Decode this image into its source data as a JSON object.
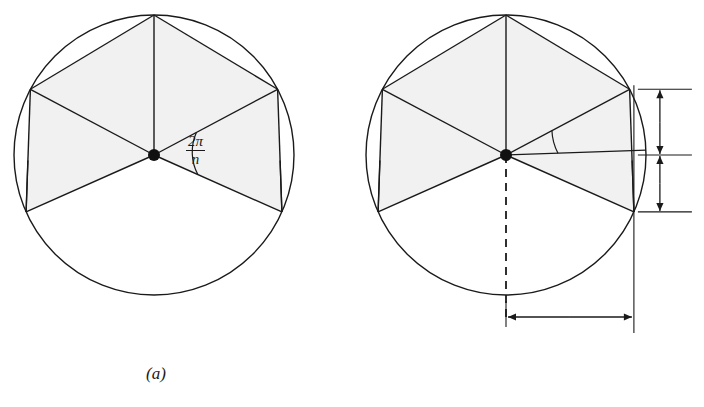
{
  "figure": {
    "kind": "geometry-diagram",
    "colors": {
      "stroke": "#1a1a1a",
      "shade": "#f1f1f1",
      "background": "#ffffff",
      "text": "#1a1a1a",
      "dashed": "#1a1a1a"
    }
  },
  "panels": [
    {
      "id": "a",
      "caption": "(a)",
      "circle": {
        "cx": 154,
        "cy": 155,
        "r": 140
      },
      "center_dot": {
        "cx": 154,
        "cy": 155,
        "r": 6
      },
      "angle_label": {
        "numerator": "2π",
        "denominator": "n",
        "full": "2π/n",
        "name": "central-angle"
      },
      "vertex_angles_deg": [
        -24,
        28,
        90,
        152,
        204
      ],
      "shaded_triangles": 4,
      "partial_chord_stubs": 2
    },
    {
      "id": "b",
      "caption": "(b)",
      "circle": {
        "cx": 506,
        "cy": 155,
        "r": 140
      },
      "center_dot": {
        "cx": 506,
        "cy": 155,
        "r": 6
      },
      "angle_label": {
        "numerator": "π",
        "denominator": "n",
        "full": "π/n",
        "name": "half-central-angle"
      },
      "dimension_labels": [
        {
          "name": "half-chord-upper",
          "lead": "r sin",
          "lead_var": "r",
          "lead_fn": "sin",
          "numerator": "π",
          "denominator": "n",
          "full": "r sin π/n"
        },
        {
          "name": "half-chord-lower",
          "lead": "r sin",
          "lead_var": "r",
          "lead_fn": "sin",
          "numerator": "π",
          "denominator": "n",
          "full": "r sin π/n"
        },
        {
          "name": "apothem",
          "lead": "r cos",
          "lead_var": "r",
          "lead_fn": "cos",
          "numerator": "π",
          "denominator": "n",
          "full": "r cos π/n"
        }
      ],
      "vertex_angles_deg": [
        -24,
        28,
        90,
        152,
        204
      ],
      "shaded_triangles": 4,
      "partial_chord_stubs": 2,
      "dashed_radius_angle_deg": 270,
      "has_horizontal_axis": true,
      "has_vertical_reference_line": true
    }
  ]
}
